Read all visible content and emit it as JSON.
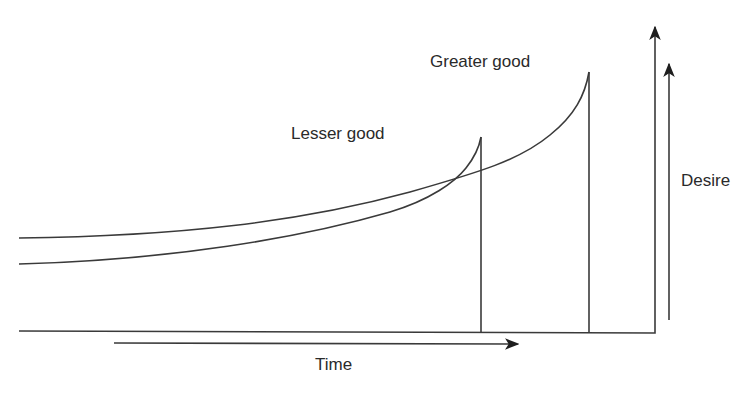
{
  "diagram": {
    "type": "hyperbolic-discounting",
    "labels": {
      "lesser_good": "Lesser good",
      "greater_good": "Greater good",
      "desire_axis": "Desire",
      "time_axis": "Time"
    },
    "curves": [
      {
        "name": "lesser-good",
        "description": "Desire for smaller sooner reward; starts lower, rises steeply, peaks earlier"
      },
      {
        "name": "greater-good",
        "description": "Desire for larger later reward; starts higher, rises gradually, peaks later and higher"
      }
    ],
    "relations": {
      "curves_cross": true,
      "lesser_good_peaks_first": true,
      "greater_good_peak_higher": true
    },
    "colors": {
      "line": "#3a3a3a",
      "text": "#2a2a2a",
      "background": "#ffffff"
    }
  }
}
